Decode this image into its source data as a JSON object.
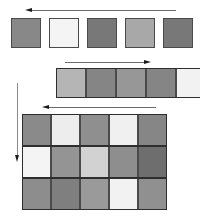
{
  "diagram": {
    "background": "#ffffff",
    "width": 200,
    "height": 221,
    "border_color": "#4a4a4a",
    "grid_line_color": "#2e2e2e",
    "arrow_line_color": "#6b6b6b",
    "arrow_head_color": "#1c1c1c"
  },
  "sections": [
    {
      "name": "top-row",
      "label": "Row of five separated tiles",
      "y": 18,
      "cell_size": 30,
      "gap": 8,
      "start_x": 11,
      "cells": [
        {
          "index": 0,
          "color": "#888888"
        },
        {
          "index": 1,
          "color": "#f4f4f4"
        },
        {
          "index": 2,
          "color": "#787878"
        },
        {
          "index": 3,
          "color": "#a8a8a8"
        },
        {
          "index": 4,
          "color": "#787878"
        }
      ]
    },
    {
      "name": "middle-row",
      "label": "Contiguous strip of five tiles",
      "y": 68,
      "cell_size": 30,
      "gap": 0,
      "start_x": 56,
      "cells": [
        {
          "index": 0,
          "color": "#b5b5b5"
        },
        {
          "index": 1,
          "color": "#858585"
        },
        {
          "index": 2,
          "color": "#979797"
        },
        {
          "index": 3,
          "color": "#858585"
        },
        {
          "index": 4,
          "color": "#f2f2f2"
        }
      ]
    },
    {
      "name": "bottom-grid",
      "label": "Five by three tile matrix",
      "x": 22,
      "y": 114,
      "cell_width": 29,
      "cell_height": 32,
      "columns": 5,
      "rows": 3,
      "matrix": [
        [
          "#8a8a8a",
          "#ededed",
          "#8f8f8f",
          "#f0f0f0",
          "#868686"
        ],
        [
          "#f4f4f4",
          "#949494",
          "#d2d2d2",
          "#8e8e8e",
          "#6e6e6e"
        ],
        [
          "#8d8d8d",
          "#7f7f7f",
          "#9a9a9a",
          "#f2f2f2",
          "#909090"
        ]
      ]
    }
  ],
  "annotations": [
    {
      "name": "top-arrow",
      "direction": "left",
      "orientation": "horizontal",
      "x1": 26,
      "x2": 176,
      "y": 10
    },
    {
      "name": "middle-arrow",
      "direction": "right",
      "orientation": "horizontal",
      "x1": 65,
      "x2": 150,
      "y": 62
    },
    {
      "name": "bottom-arrow",
      "direction": "left",
      "orientation": "horizontal",
      "x1": 43,
      "x2": 156,
      "y": 107
    },
    {
      "name": "vertical-arrow",
      "direction": "down",
      "orientation": "vertical",
      "x": 17,
      "y1": 83,
      "y2": 160
    }
  ]
}
